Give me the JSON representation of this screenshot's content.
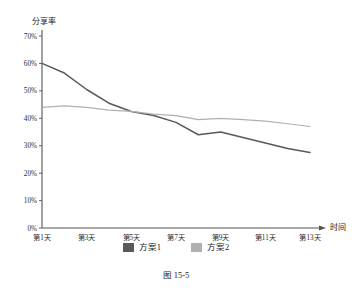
{
  "caption": "图 15-5",
  "legend": {
    "position": "bottom-center",
    "items": [
      {
        "label": "方案1",
        "color": "#595959"
      },
      {
        "label": "方案2",
        "color": "#b0b0b0"
      }
    ]
  },
  "chart_data": {
    "type": "line",
    "title": "",
    "subtitle": "",
    "xlabel": "时间",
    "ylabel": "分享率",
    "ylim": [
      0,
      70
    ],
    "yticks": [
      0,
      10,
      20,
      30,
      40,
      50,
      60,
      70
    ],
    "ytick_labels": [
      "0%",
      "10%",
      "20%",
      "30%",
      "40%",
      "50%",
      "60%",
      "70%"
    ],
    "grid": false,
    "x": [
      1,
      2,
      3,
      4,
      5,
      6,
      7,
      8,
      9,
      10,
      11,
      12,
      13
    ],
    "categories": [
      "第1天",
      "第2天",
      "第3天",
      "第4天",
      "第5天",
      "第6天",
      "第7天",
      "第8天",
      "第9天",
      "第10天",
      "第11天",
      "第12天",
      "第13天"
    ],
    "xtick_labels": [
      "第1天",
      "第3天",
      "第5天",
      "第7天",
      "第9天",
      "第11天",
      "第13天"
    ],
    "xtick_values": [
      1,
      3,
      5,
      7,
      9,
      11,
      13
    ],
    "series": [
      {
        "name": "方案1",
        "color": "#595959",
        "values": [
          60.0,
          56.5,
          50.5,
          45.5,
          42.5,
          41.0,
          38.5,
          34.0,
          35.0,
          33.0,
          31.0,
          29.0,
          27.5
        ]
      },
      {
        "name": "方案2",
        "color": "#b0b0b0",
        "values": [
          44.0,
          44.5,
          44.0,
          43.0,
          42.5,
          41.5,
          41.0,
          39.5,
          40.0,
          39.5,
          39.0,
          38.0,
          37.0
        ]
      }
    ]
  }
}
